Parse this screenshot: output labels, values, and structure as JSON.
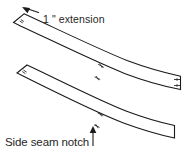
{
  "figure": {
    "type": "sewing-pattern-diagram",
    "background_color": "#ffffff",
    "line_color": "#1a1a1a",
    "text_color": "#262626"
  },
  "annotations": {
    "extension_label": "1 \" extension",
    "extension_value": "1",
    "extension_unit": "\"",
    "extension_word": "extension",
    "side_seam_label": "Side seam notch",
    "side_seam_arrow_glyph": "↑"
  },
  "pieces": [
    {
      "name": "upper-waistband-piece",
      "description": "Upper curved waistband band with extension tab at left end and double notch at right end",
      "notch_count": 3
    },
    {
      "name": "lower-waistband-piece",
      "description": "Lower curved waistband band with notch marks at left end and plain right end",
      "notch_count": 3
    }
  ],
  "notch_marks": [
    {
      "name": "notch-upper-left-extension",
      "piece": "upper-waistband-piece"
    },
    {
      "name": "notch-upper-mid-outer",
      "piece": "upper-waistband-piece"
    },
    {
      "name": "notch-upper-mid-inner",
      "piece": "upper-waistband-piece"
    },
    {
      "name": "notch-upper-right-double",
      "piece": "upper-waistband-piece"
    },
    {
      "name": "notch-lower-left",
      "piece": "lower-waistband-piece"
    },
    {
      "name": "notch-lower-mid-outer",
      "piece": "lower-waistband-piece"
    },
    {
      "name": "notch-lower-mid-inner",
      "piece": "lower-waistband-piece"
    }
  ]
}
